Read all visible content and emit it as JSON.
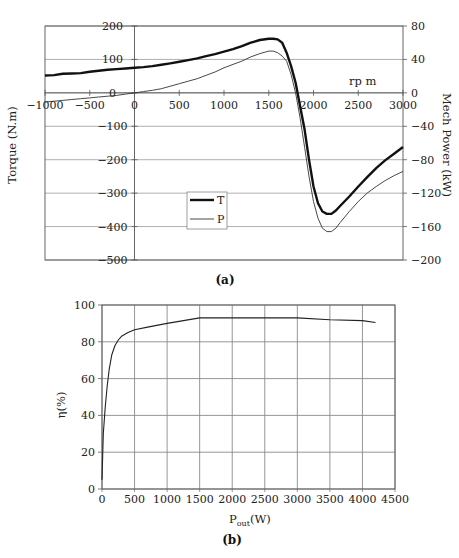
{
  "chart_data": [
    {
      "id": "a",
      "type": "line",
      "caption": "(a)",
      "title": "",
      "xlabel": "rp m",
      "ylabel": "Torque (N.m)",
      "y2label": "Mech Power (kW)",
      "xlim": [
        -1000,
        3000
      ],
      "ylim": [
        -500,
        200
      ],
      "y2lim": [
        -200,
        80
      ],
      "x_ticks": [
        -1000,
        -500,
        0,
        500,
        1000,
        1500,
        2000,
        2500,
        3000
      ],
      "y_ticks": [
        200,
        100,
        0,
        -100,
        -200,
        -300,
        -400,
        -500
      ],
      "y2_ticks": [
        80,
        40,
        0,
        -40,
        -80,
        -120,
        -160,
        -200
      ],
      "grid": true,
      "legend": {
        "position": "inside-lower-middle",
        "entries": [
          "T",
          "P"
        ]
      },
      "series": [
        {
          "name": "T",
          "axis": "left",
          "style": "thick",
          "x": [
            -1000,
            -900,
            -800,
            -700,
            -600,
            -500,
            -400,
            -300,
            -200,
            -100,
            0,
            100,
            200,
            300,
            400,
            500,
            600,
            700,
            800,
            900,
            1000,
            1100,
            1200,
            1300,
            1400,
            1500,
            1550,
            1600,
            1650,
            1700,
            1750,
            1800,
            1850,
            1900,
            1950,
            2000,
            2050,
            2100,
            2150,
            2200,
            2250,
            2300,
            2400,
            2500,
            2600,
            2700,
            2800,
            2900,
            3000
          ],
          "values": [
            52,
            53,
            57,
            58,
            59,
            63,
            66,
            69,
            71,
            73,
            75,
            77,
            80,
            84,
            88,
            93,
            98,
            103,
            110,
            116,
            123,
            131,
            140,
            150,
            158,
            162,
            162,
            160,
            150,
            120,
            80,
            30,
            -40,
            -110,
            -200,
            -280,
            -330,
            -355,
            -362,
            -362,
            -352,
            -338,
            -310,
            -280,
            -252,
            -225,
            -202,
            -182,
            -162
          ]
        },
        {
          "name": "P",
          "axis": "right",
          "style": "thin",
          "x": [
            -1000,
            -900,
            -800,
            -700,
            -600,
            -500,
            -400,
            -300,
            -200,
            -100,
            0,
            100,
            200,
            300,
            400,
            500,
            600,
            700,
            800,
            900,
            1000,
            1100,
            1200,
            1300,
            1400,
            1500,
            1550,
            1600,
            1650,
            1700,
            1750,
            1800,
            1850,
            1900,
            1950,
            2000,
            2050,
            2100,
            2150,
            2200,
            2250,
            2300,
            2400,
            2500,
            2600,
            2700,
            2800,
            2900,
            3000
          ],
          "values": [
            -11,
            -10,
            -9,
            -8,
            -7,
            -6,
            -5,
            -4,
            -3,
            -1.5,
            0,
            1.5,
            3,
            5,
            8,
            11,
            14,
            17,
            21,
            25,
            30,
            34,
            38,
            43,
            47,
            50,
            50,
            48,
            44,
            38,
            22,
            0,
            -30,
            -65,
            -100,
            -130,
            -150,
            -162,
            -166,
            -166,
            -162,
            -155,
            -142,
            -130,
            -120,
            -112,
            -105,
            -99,
            -94
          ]
        }
      ]
    },
    {
      "id": "b",
      "type": "line",
      "caption": "(b)",
      "title": "",
      "xlabel": "P",
      "xlabel_sub": "out",
      "xlabel_suffix": "(W)",
      "ylabel": "η(%)",
      "xlim": [
        0,
        4500
      ],
      "ylim": [
        0,
        100
      ],
      "x_ticks": [
        0,
        500,
        1000,
        1500,
        2000,
        2500,
        3000,
        3500,
        4000,
        4500
      ],
      "y_ticks": [
        0,
        20,
        40,
        60,
        80,
        100
      ],
      "grid": true,
      "series": [
        {
          "name": "η",
          "x": [
            0,
            20,
            50,
            80,
            110,
            150,
            200,
            250,
            300,
            400,
            500,
            700,
            1000,
            1250,
            1500,
            2000,
            2500,
            3000,
            3500,
            4000,
            4200
          ],
          "values": [
            5,
            30,
            45,
            56,
            65,
            73,
            78,
            81,
            83,
            85,
            86.5,
            88,
            90,
            91.5,
            93,
            93,
            93,
            93,
            92,
            91.5,
            90.5
          ]
        }
      ]
    }
  ]
}
